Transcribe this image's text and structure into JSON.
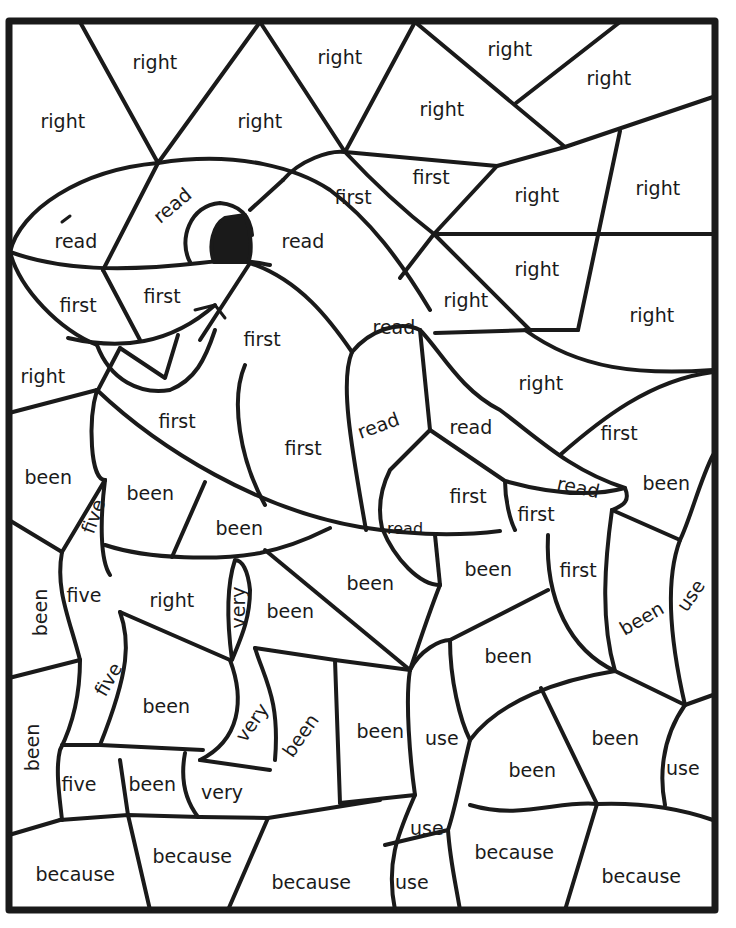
{
  "worksheet": {
    "title": "Color by sight word",
    "line_color": "#1a1a1a",
    "background": "#ffffff",
    "words_used": [
      "right",
      "read",
      "first",
      "been",
      "five",
      "very",
      "use",
      "because"
    ],
    "regions": [
      {
        "word": "right",
        "x": 155,
        "y": 62,
        "rot": 0
      },
      {
        "word": "right",
        "x": 340,
        "y": 57,
        "rot": 0
      },
      {
        "word": "right",
        "x": 510,
        "y": 49,
        "rot": 0
      },
      {
        "word": "right",
        "x": 609,
        "y": 78,
        "rot": 0
      },
      {
        "word": "right",
        "x": 63,
        "y": 121,
        "rot": 0
      },
      {
        "word": "right",
        "x": 260,
        "y": 121,
        "rot": 0
      },
      {
        "word": "right",
        "x": 442,
        "y": 109,
        "rot": 0
      },
      {
        "word": "read",
        "x": 172,
        "y": 205,
        "rot": -40
      },
      {
        "word": "read",
        "x": 76,
        "y": 241,
        "rot": 0
      },
      {
        "word": "first",
        "x": 353,
        "y": 197,
        "rot": 0
      },
      {
        "word": "first",
        "x": 431,
        "y": 177,
        "rot": 0
      },
      {
        "word": "right",
        "x": 537,
        "y": 195,
        "rot": 0
      },
      {
        "word": "right",
        "x": 658,
        "y": 188,
        "rot": 0
      },
      {
        "word": "read",
        "x": 303,
        "y": 241,
        "rot": 0
      },
      {
        "word": "right",
        "x": 537,
        "y": 269,
        "rot": 0
      },
      {
        "word": "first",
        "x": 78,
        "y": 305,
        "rot": 0
      },
      {
        "word": "first",
        "x": 162,
        "y": 296,
        "rot": 0
      },
      {
        "word": "right",
        "x": 466,
        "y": 300,
        "rot": 0
      },
      {
        "word": "right",
        "x": 652,
        "y": 315,
        "rot": 0
      },
      {
        "word": "read",
        "x": 394,
        "y": 327,
        "rot": 0
      },
      {
        "word": "first",
        "x": 262,
        "y": 339,
        "rot": 0
      },
      {
        "word": "right",
        "x": 43,
        "y": 376,
        "rot": 0
      },
      {
        "word": "right",
        "x": 541,
        "y": 383,
        "rot": 0
      },
      {
        "word": "first",
        "x": 177,
        "y": 421,
        "rot": 0
      },
      {
        "word": "read",
        "x": 378,
        "y": 425,
        "rot": -20
      },
      {
        "word": "read",
        "x": 471,
        "y": 427,
        "rot": 0
      },
      {
        "word": "first",
        "x": 619,
        "y": 433,
        "rot": 0
      },
      {
        "word": "first",
        "x": 303,
        "y": 448,
        "rot": 0
      },
      {
        "word": "been",
        "x": 48,
        "y": 477,
        "rot": 0
      },
      {
        "word": "been",
        "x": 666,
        "y": 483,
        "rot": 0
      },
      {
        "word": "read",
        "x": 578,
        "y": 487,
        "rot": 12
      },
      {
        "word": "been",
        "x": 150,
        "y": 493,
        "rot": 0
      },
      {
        "word": "first",
        "x": 468,
        "y": 496,
        "rot": 0
      },
      {
        "word": "first",
        "x": 536,
        "y": 514,
        "rot": 0
      },
      {
        "word": "five",
        "x": 93,
        "y": 516,
        "rot": -70
      },
      {
        "word": "been",
        "x": 239,
        "y": 528,
        "rot": 0
      },
      {
        "word": "read",
        "x": 405,
        "y": 529,
        "rot": 0,
        "small": true
      },
      {
        "word": "been",
        "x": 488,
        "y": 569,
        "rot": 0
      },
      {
        "word": "first",
        "x": 578,
        "y": 570,
        "rot": 0
      },
      {
        "word": "been",
        "x": 370,
        "y": 583,
        "rot": 0
      },
      {
        "word": "five",
        "x": 84,
        "y": 595,
        "rot": 0
      },
      {
        "word": "been",
        "x": 40,
        "y": 612,
        "rot": -90
      },
      {
        "word": "right",
        "x": 172,
        "y": 600,
        "rot": 0
      },
      {
        "word": "very",
        "x": 238,
        "y": 607,
        "rot": -90
      },
      {
        "word": "been",
        "x": 290,
        "y": 611,
        "rot": 0
      },
      {
        "word": "been",
        "x": 641,
        "y": 618,
        "rot": -30
      },
      {
        "word": "use",
        "x": 691,
        "y": 595,
        "rot": -55
      },
      {
        "word": "been",
        "x": 508,
        "y": 656,
        "rot": 0
      },
      {
        "word": "five",
        "x": 108,
        "y": 679,
        "rot": -60
      },
      {
        "word": "been",
        "x": 166,
        "y": 706,
        "rot": 0
      },
      {
        "word": "very",
        "x": 252,
        "y": 722,
        "rot": -55
      },
      {
        "word": "been",
        "x": 300,
        "y": 735,
        "rot": -55
      },
      {
        "word": "been",
        "x": 380,
        "y": 731,
        "rot": 0
      },
      {
        "word": "use",
        "x": 442,
        "y": 738,
        "rot": 0
      },
      {
        "word": "been",
        "x": 615,
        "y": 738,
        "rot": 0
      },
      {
        "word": "been",
        "x": 32,
        "y": 747,
        "rot": -90
      },
      {
        "word": "been",
        "x": 532,
        "y": 770,
        "rot": 0
      },
      {
        "word": "use",
        "x": 683,
        "y": 768,
        "rot": 0
      },
      {
        "word": "five",
        "x": 79,
        "y": 784,
        "rot": 0
      },
      {
        "word": "been",
        "x": 152,
        "y": 784,
        "rot": 0
      },
      {
        "word": "very",
        "x": 222,
        "y": 792,
        "rot": 0
      },
      {
        "word": "use",
        "x": 427,
        "y": 828,
        "rot": 0
      },
      {
        "word": "because",
        "x": 192,
        "y": 856,
        "rot": 0
      },
      {
        "word": "because",
        "x": 514,
        "y": 852,
        "rot": 0
      },
      {
        "word": "because",
        "x": 75,
        "y": 874,
        "rot": 0
      },
      {
        "word": "because",
        "x": 641,
        "y": 876,
        "rot": 0
      },
      {
        "word": "because",
        "x": 311,
        "y": 882,
        "rot": 0
      },
      {
        "word": "use",
        "x": 412,
        "y": 882,
        "rot": 0
      }
    ]
  }
}
